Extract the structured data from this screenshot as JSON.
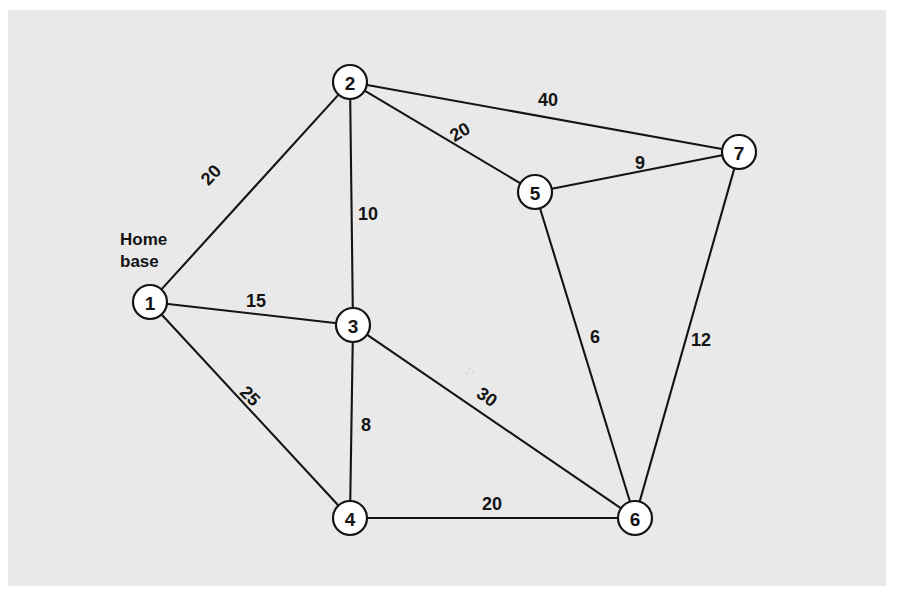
{
  "figure": {
    "type": "weighted-undirected-graph",
    "background_color": "#ffffff",
    "panel_color": "#e9e9e9",
    "line_color": "#141414",
    "node_fill_color": "#ffffff"
  },
  "annotations": {
    "home_base_line1": "Home",
    "home_base_line2": "base",
    "home_base_node": "1"
  },
  "chart_data": {
    "type": "diagram",
    "title": "",
    "xlabel": "",
    "ylabel": "",
    "nodes": [
      {
        "id": "1",
        "label": "1",
        "x": 150,
        "y": 302,
        "r": 17,
        "annotation": "Home base"
      },
      {
        "id": "2",
        "label": "2",
        "x": 350,
        "y": 82,
        "r": 17,
        "annotation": ""
      },
      {
        "id": "3",
        "label": "3",
        "x": 353,
        "y": 325,
        "r": 17,
        "annotation": ""
      },
      {
        "id": "4",
        "label": "4",
        "x": 350,
        "y": 518,
        "r": 17,
        "annotation": ""
      },
      {
        "id": "5",
        "label": "5",
        "x": 535,
        "y": 192,
        "r": 17,
        "annotation": ""
      },
      {
        "id": "6",
        "label": "6",
        "x": 635,
        "y": 518,
        "r": 17,
        "annotation": ""
      },
      {
        "id": "7",
        "label": "7",
        "x": 739,
        "y": 152,
        "r": 17,
        "annotation": ""
      }
    ],
    "edges": [
      {
        "source": "1",
        "target": "2",
        "weight": 20,
        "label": "20",
        "lx": 211,
        "ly": 175,
        "rot": -47
      },
      {
        "source": "1",
        "target": "3",
        "weight": 15,
        "label": "15",
        "lx": 256,
        "ly": 301,
        "rot": 0
      },
      {
        "source": "1",
        "target": "4",
        "weight": 25,
        "label": "25",
        "lx": 250,
        "ly": 396,
        "rot": 45
      },
      {
        "source": "2",
        "target": "3",
        "weight": 10,
        "label": "10",
        "lx": 368,
        "ly": 214,
        "rot": 0
      },
      {
        "source": "2",
        "target": "5",
        "weight": 20,
        "label": "20",
        "lx": 460,
        "ly": 132,
        "rot": -31
      },
      {
        "source": "2",
        "target": "7",
        "weight": 40,
        "label": "40",
        "lx": 548,
        "ly": 100,
        "rot": 0
      },
      {
        "source": "3",
        "target": "4",
        "weight": 8,
        "label": "8",
        "lx": 366,
        "ly": 425,
        "rot": 0
      },
      {
        "source": "3",
        "target": "6",
        "weight": 30,
        "label": "30",
        "lx": 487,
        "ly": 397,
        "rot": 35
      },
      {
        "source": "4",
        "target": "6",
        "weight": 20,
        "label": "20",
        "lx": 492,
        "ly": 504,
        "rot": 0
      },
      {
        "source": "5",
        "target": "6",
        "weight": 6,
        "label": "6",
        "lx": 595,
        "ly": 337,
        "rot": 0
      },
      {
        "source": "5",
        "target": "7",
        "weight": 9,
        "label": "9",
        "lx": 640,
        "ly": 163,
        "rot": 0
      },
      {
        "source": "6",
        "target": "7",
        "weight": 12,
        "label": "12",
        "lx": 701,
        "ly": 340,
        "rot": 0
      }
    ],
    "legend": []
  }
}
